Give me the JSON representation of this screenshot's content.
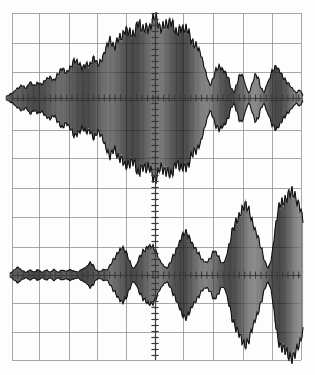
{
  "display": {
    "kind": "oscilloscope-graticule-display",
    "width": 315,
    "height": 375,
    "background_color": "#fdfdfd",
    "trace_color": "#1c1c1c",
    "graticule_color": "#8c8c8c",
    "axis_color": "#3a3a3a"
  },
  "graticule": {
    "left": 12,
    "right": 301,
    "top": 13,
    "bottom": 360,
    "vertical_lines_x": [
      12,
      39,
      69,
      97,
      126,
      155,
      183,
      213,
      243,
      272,
      301
    ],
    "horizontal_lines_y": [
      13,
      43,
      72,
      100,
      130,
      158,
      188,
      217,
      247,
      275,
      303,
      332,
      360
    ],
    "divisions_x": 10,
    "divisions_y": 12,
    "grid_visible": "on",
    "minor_tick_count_per_division": 5
  },
  "axes": {
    "upper": {
      "center_x": 155,
      "center_y": 98,
      "x_axis_label": "upper-trace-horizontal-axis",
      "y_axis_label": "upper-trace-vertical-axis"
    },
    "lower": {
      "center_x": 155,
      "center_y": 275,
      "x_axis_label": "lower-trace-horizontal-axis",
      "y_axis_label": "lower-trace-vertical-axis"
    }
  },
  "chart_data": {
    "type": "line",
    "title": "",
    "subtitle": "",
    "xlabel": "",
    "ylabel": "",
    "grid": true,
    "legend": "none",
    "xlim": [
      0,
      315
    ],
    "series": [
      {
        "name": "upper-trace",
        "description": "amplitude-modulated burst, symmetric about center, broad central lobe with side lobes",
        "center_y": 98,
        "ylim": [
          -88,
          88
        ],
        "envelope_points": [
          {
            "x": 6,
            "amp": 2
          },
          {
            "x": 12,
            "amp": 5
          },
          {
            "x": 18,
            "amp": 10
          },
          {
            "x": 22,
            "amp": 14
          },
          {
            "x": 26,
            "amp": 11
          },
          {
            "x": 30,
            "amp": 16
          },
          {
            "x": 34,
            "amp": 13
          },
          {
            "x": 38,
            "amp": 17
          },
          {
            "x": 42,
            "amp": 15
          },
          {
            "x": 46,
            "amp": 19
          },
          {
            "x": 50,
            "amp": 22
          },
          {
            "x": 54,
            "amp": 20
          },
          {
            "x": 58,
            "amp": 26
          },
          {
            "x": 62,
            "amp": 30
          },
          {
            "x": 66,
            "amp": 27
          },
          {
            "x": 70,
            "amp": 34
          },
          {
            "x": 74,
            "amp": 40
          },
          {
            "x": 78,
            "amp": 36
          },
          {
            "x": 82,
            "amp": 33
          },
          {
            "x": 86,
            "amp": 38
          },
          {
            "x": 90,
            "amp": 35
          },
          {
            "x": 94,
            "amp": 41
          },
          {
            "x": 98,
            "amp": 37
          },
          {
            "x": 102,
            "amp": 44
          },
          {
            "x": 106,
            "amp": 52
          },
          {
            "x": 110,
            "amp": 60
          },
          {
            "x": 114,
            "amp": 57
          },
          {
            "x": 118,
            "amp": 66
          },
          {
            "x": 122,
            "amp": 63
          },
          {
            "x": 126,
            "amp": 71
          },
          {
            "x": 130,
            "amp": 74
          },
          {
            "x": 134,
            "amp": 70
          },
          {
            "x": 138,
            "amp": 77
          },
          {
            "x": 142,
            "amp": 73
          },
          {
            "x": 146,
            "amp": 80
          },
          {
            "x": 150,
            "amp": 76
          },
          {
            "x": 155,
            "amp": 84
          },
          {
            "x": 160,
            "amp": 78
          },
          {
            "x": 164,
            "amp": 81
          },
          {
            "x": 168,
            "amp": 76
          },
          {
            "x": 172,
            "amp": 79
          },
          {
            "x": 176,
            "amp": 74
          },
          {
            "x": 180,
            "amp": 76
          },
          {
            "x": 184,
            "amp": 70
          },
          {
            "x": 188,
            "amp": 72
          },
          {
            "x": 192,
            "amp": 64
          },
          {
            "x": 196,
            "amp": 57
          },
          {
            "x": 200,
            "amp": 47
          },
          {
            "x": 204,
            "amp": 35
          },
          {
            "x": 207,
            "amp": 24
          },
          {
            "x": 210,
            "amp": 14
          },
          {
            "x": 213,
            "amp": 20
          },
          {
            "x": 216,
            "amp": 29
          },
          {
            "x": 220,
            "amp": 34
          },
          {
            "x": 224,
            "amp": 31
          },
          {
            "x": 228,
            "amp": 22
          },
          {
            "x": 231,
            "amp": 10
          },
          {
            "x": 234,
            "amp": 6
          },
          {
            "x": 237,
            "amp": 16
          },
          {
            "x": 240,
            "amp": 27
          },
          {
            "x": 243,
            "amp": 23
          },
          {
            "x": 246,
            "amp": 11
          },
          {
            "x": 249,
            "amp": 5
          },
          {
            "x": 252,
            "amp": 15
          },
          {
            "x": 255,
            "amp": 26
          },
          {
            "x": 258,
            "amp": 22
          },
          {
            "x": 261,
            "amp": 10
          },
          {
            "x": 264,
            "amp": 6
          },
          {
            "x": 268,
            "amp": 18
          },
          {
            "x": 272,
            "amp": 29
          },
          {
            "x": 276,
            "amp": 32
          },
          {
            "x": 280,
            "amp": 28
          },
          {
            "x": 284,
            "amp": 22
          },
          {
            "x": 288,
            "amp": 16
          },
          {
            "x": 292,
            "amp": 10
          },
          {
            "x": 296,
            "amp": 6
          },
          {
            "x": 300,
            "amp": 9
          },
          {
            "x": 303,
            "amp": 3
          }
        ]
      },
      {
        "name": "lower-trace",
        "description": "amplitude-modulated burst train growing left to right, small lobes expanding to large lobes",
        "center_y": 275,
        "ylim": [
          -88,
          88
        ],
        "envelope_points": [
          {
            "x": 10,
            "amp": 2
          },
          {
            "x": 14,
            "amp": 5
          },
          {
            "x": 18,
            "amp": 8
          },
          {
            "x": 22,
            "amp": 5
          },
          {
            "x": 26,
            "amp": 3
          },
          {
            "x": 30,
            "amp": 5
          },
          {
            "x": 34,
            "amp": 3
          },
          {
            "x": 38,
            "amp": 6
          },
          {
            "x": 42,
            "amp": 3
          },
          {
            "x": 46,
            "amp": 5
          },
          {
            "x": 50,
            "amp": 3
          },
          {
            "x": 54,
            "amp": 6
          },
          {
            "x": 58,
            "amp": 3
          },
          {
            "x": 62,
            "amp": 5
          },
          {
            "x": 66,
            "amp": 4
          },
          {
            "x": 70,
            "amp": 6
          },
          {
            "x": 74,
            "amp": 4
          },
          {
            "x": 78,
            "amp": 3
          },
          {
            "x": 82,
            "amp": 6
          },
          {
            "x": 86,
            "amp": 9
          },
          {
            "x": 90,
            "amp": 13
          },
          {
            "x": 93,
            "amp": 10
          },
          {
            "x": 96,
            "amp": 5
          },
          {
            "x": 100,
            "amp": 4
          },
          {
            "x": 104,
            "amp": 6
          },
          {
            "x": 107,
            "amp": 5
          },
          {
            "x": 110,
            "amp": 10
          },
          {
            "x": 114,
            "amp": 18
          },
          {
            "x": 118,
            "amp": 25
          },
          {
            "x": 122,
            "amp": 28
          },
          {
            "x": 126,
            "amp": 24
          },
          {
            "x": 130,
            "amp": 15
          },
          {
            "x": 133,
            "amp": 7
          },
          {
            "x": 136,
            "amp": 10
          },
          {
            "x": 140,
            "amp": 19
          },
          {
            "x": 144,
            "amp": 27
          },
          {
            "x": 148,
            "amp": 32
          },
          {
            "x": 152,
            "amp": 30
          },
          {
            "x": 156,
            "amp": 24
          },
          {
            "x": 160,
            "amp": 16
          },
          {
            "x": 164,
            "amp": 10
          },
          {
            "x": 167,
            "amp": 7
          },
          {
            "x": 170,
            "amp": 12
          },
          {
            "x": 174,
            "amp": 22
          },
          {
            "x": 178,
            "amp": 33
          },
          {
            "x": 182,
            "amp": 41
          },
          {
            "x": 186,
            "amp": 44
          },
          {
            "x": 190,
            "amp": 40
          },
          {
            "x": 194,
            "amp": 32
          },
          {
            "x": 198,
            "amp": 23
          },
          {
            "x": 202,
            "amp": 16
          },
          {
            "x": 206,
            "amp": 14
          },
          {
            "x": 210,
            "amp": 18
          },
          {
            "x": 214,
            "amp": 25
          },
          {
            "x": 218,
            "amp": 20
          },
          {
            "x": 222,
            "amp": 13
          },
          {
            "x": 225,
            "amp": 16
          },
          {
            "x": 229,
            "amp": 30
          },
          {
            "x": 233,
            "amp": 48
          },
          {
            "x": 237,
            "amp": 62
          },
          {
            "x": 241,
            "amp": 70
          },
          {
            "x": 245,
            "amp": 72
          },
          {
            "x": 249,
            "amp": 68
          },
          {
            "x": 253,
            "amp": 58
          },
          {
            "x": 257,
            "amp": 44
          },
          {
            "x": 261,
            "amp": 28
          },
          {
            "x": 265,
            "amp": 14
          },
          {
            "x": 268,
            "amp": 8
          },
          {
            "x": 271,
            "amp": 16
          },
          {
            "x": 274,
            "amp": 38
          },
          {
            "x": 277,
            "amp": 60
          },
          {
            "x": 280,
            "amp": 76
          },
          {
            "x": 284,
            "amp": 84
          },
          {
            "x": 288,
            "amp": 86
          },
          {
            "x": 292,
            "amp": 85
          },
          {
            "x": 296,
            "amp": 82
          },
          {
            "x": 300,
            "amp": 78
          },
          {
            "x": 303,
            "amp": 60
          }
        ]
      }
    ]
  }
}
